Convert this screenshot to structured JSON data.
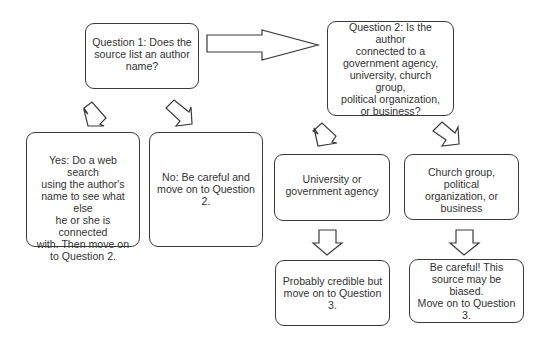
{
  "diagram": {
    "type": "flowchart",
    "nodes": {
      "q1": {
        "text": "Question 1: Does the\nsource list an author\nname?"
      },
      "yes": {
        "text": "Yes: Do a web search\nusing the author's\nname to see what else\nhe or she is connected\nwith. Then move on\nto Question 2."
      },
      "no": {
        "text": "No: Be careful and\nmove on to Question\n2."
      },
      "q2": {
        "text": "Question 2: Is the author\nconnected to a\ngovernment agency,\nuniversity, church group,\npolitical organization,\nor business?"
      },
      "university": {
        "text": "University or\ngovernment agency"
      },
      "church": {
        "text": "Church group, political\norganization, or\nbusiness"
      },
      "credible": {
        "text": "Probably credible but\nmove on to Question 3."
      },
      "biased": {
        "text": "Be careful!  This\nsource may be biased.\nMove on to Question 3."
      }
    },
    "edges": [
      {
        "from": "q1",
        "to": "yes",
        "style": "tilted-block-arrow"
      },
      {
        "from": "q1",
        "to": "no",
        "style": "tilted-block-arrow"
      },
      {
        "from": "q1",
        "to": "q2",
        "style": "block-arrow-right"
      },
      {
        "from": "q2",
        "to": "university",
        "style": "tilted-block-arrow"
      },
      {
        "from": "q2",
        "to": "church",
        "style": "tilted-block-arrow"
      },
      {
        "from": "university",
        "to": "credible",
        "style": "block-arrow-down"
      },
      {
        "from": "church",
        "to": "biased",
        "style": "block-arrow-down"
      }
    ],
    "colors": {
      "stroke": "#3a3a3a",
      "text": "#333333",
      "background": "#ffffff"
    }
  }
}
